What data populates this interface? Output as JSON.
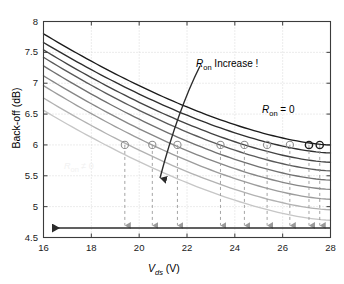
{
  "chart_data": {
    "type": "line",
    "title": "",
    "xlabel": "V_ds (V)",
    "ylabel": "Back-off (dB)",
    "xlim": [
      16,
      28
    ],
    "ylim": [
      4.5,
      8
    ],
    "xticks": [
      16,
      18,
      20,
      22,
      24,
      26,
      28
    ],
    "yticks": [
      4.5,
      5,
      5.5,
      6,
      6.5,
      7,
      7.5,
      8
    ],
    "grid": true,
    "legend": "none",
    "series": [
      {
        "name": "Ron = 0",
        "shade": "#1a1a1a",
        "y_at_16": 7.8,
        "y_at_28": 6.0,
        "cross6_x": 27.55
      },
      {
        "name": "Ron step 1",
        "shade": "#2e2e2e",
        "y_at_16": 7.66,
        "y_at_28": 5.87,
        "cross6_x": 27.1
      },
      {
        "name": "Ron step 2",
        "shade": "#434343",
        "y_at_16": 7.54,
        "y_at_28": 5.72,
        "cross6_x": 26.3
      },
      {
        "name": "Ron step 3",
        "shade": "#5a5a5a",
        "y_at_16": 7.42,
        "y_at_28": 5.58,
        "cross6_x": 25.35
      },
      {
        "name": "Ron step 4",
        "shade": "#707070",
        "y_at_16": 7.28,
        "y_at_28": 5.43,
        "cross6_x": 24.4
      },
      {
        "name": "Ron step 5",
        "shade": "#868686",
        "y_at_16": 7.12,
        "y_at_28": 5.28,
        "cross6_x": 23.4
      },
      {
        "name": "Ron step 6",
        "shade": "#9c9c9c",
        "y_at_16": 6.96,
        "y_at_28": 5.12,
        "cross6_x": 21.6
      },
      {
        "name": "Ron step 7",
        "shade": "#b2b2b2",
        "y_at_16": 6.76,
        "y_at_28": 4.95,
        "cross6_x": 20.55
      },
      {
        "name": "Ron step 8",
        "shade": "#c6c6c6",
        "y_at_16": 6.56,
        "y_at_28": 4.78,
        "cross6_x": 19.4
      }
    ],
    "markers": {
      "symbol": "circle",
      "y": 6.0,
      "x_values": [
        19.4,
        20.55,
        21.6,
        23.4,
        24.4,
        25.35,
        26.3,
        27.1,
        27.55
      ]
    },
    "annotations": [
      {
        "name": "ron-increase",
        "text": "R_on Increase !",
        "x": 23.4,
        "y": 7.28,
        "arrow": "curved-down-left"
      },
      {
        "name": "ron-zero",
        "text": "R_on = 0",
        "x": 25.9,
        "y": 6.52
      },
      {
        "name": "ron-nonzero-faint",
        "text": "R_on ≠ 0",
        "x": 17.3,
        "y": 5.73
      },
      {
        "name": "backoff-reduction-arrow",
        "text": "",
        "direction": "left",
        "y": 4.7
      }
    ]
  },
  "axis": {
    "y_label": "Back-off (dB)",
    "x_label_v": "V",
    "x_label_sub": "ds",
    "x_label_unit": " (V)",
    "x_tick_labels": [
      "16",
      "18",
      "20",
      "22",
      "24",
      "26",
      "28"
    ],
    "y_tick_labels": [
      "4.5",
      "5",
      "5.5",
      "6",
      "6.5",
      "7",
      "7.5",
      "8"
    ]
  },
  "annotations": {
    "increase_r": "R",
    "increase_sub": "on",
    "increase_rest": " Increase !",
    "ron0_r": "R",
    "ron0_sub": "on",
    "ron0_rest": " = 0",
    "ronne0_r": "R",
    "ronne0_sub": "on",
    "ronne0_rest": " ≠ 0"
  },
  "colors": {
    "axis": "#3b3b3b",
    "grid": "#d8d8d8",
    "darkest_curve": "#1a1a1a",
    "lightest_curve": "#c6c6c6",
    "marker": "#8a8a8a",
    "arrow": "#2b2b2b"
  }
}
